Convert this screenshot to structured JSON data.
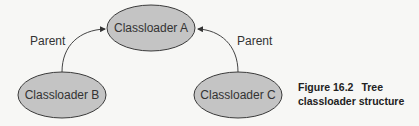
{
  "nodes": {
    "a": {
      "label": "Classloader A"
    },
    "b": {
      "label": "Classloader B"
    },
    "c": {
      "label": "Classloader C"
    }
  },
  "edges": {
    "b_to_a": {
      "label": "Parent"
    },
    "c_to_a": {
      "label": "Parent"
    }
  },
  "caption": {
    "figure": "Figure 16.2",
    "line1_rest": "Tree",
    "line2": "classloader structure"
  },
  "colors": {
    "node_fill": "#c4c4c4",
    "node_stroke": "#3a3a3a",
    "background": "#f7f7f5"
  }
}
